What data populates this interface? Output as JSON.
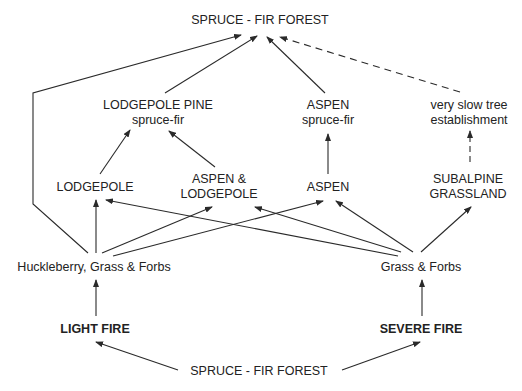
{
  "diagram": {
    "type": "succession-flow",
    "nodes": {
      "top_forest": {
        "label": "SPRUCE - FIR FOREST"
      },
      "lodgepole_pine_sf": {
        "line1": "LODGEPOLE PINE",
        "line2": "spruce-fir"
      },
      "aspen_sf": {
        "line1": "ASPEN",
        "line2": "spruce-fir"
      },
      "slow_tree": {
        "line1": "very slow tree",
        "line2": "establishment"
      },
      "lodgepole": {
        "label": "LODGEPOLE"
      },
      "aspen_lodgepole": {
        "line1": "ASPEN &",
        "line2": "LODGEPOLE"
      },
      "aspen": {
        "label": "ASPEN"
      },
      "subalpine": {
        "line1": "SUBALPINE",
        "line2": "GRASSLAND"
      },
      "huckleberry": {
        "label": "Huckleberry, Grass & Forbs"
      },
      "grass_forbs": {
        "label": "Grass & Forbs"
      },
      "light_fire": {
        "label": "LIGHT FIRE"
      },
      "severe_fire": {
        "label": "SEVERE FIRE"
      },
      "bottom_forest": {
        "label": "SPRUCE - FIR FOREST"
      }
    },
    "edges": [
      {
        "from": "bottom_forest",
        "to": "light_fire",
        "style": "solid"
      },
      {
        "from": "bottom_forest",
        "to": "severe_fire",
        "style": "solid"
      },
      {
        "from": "light_fire",
        "to": "huckleberry",
        "style": "solid"
      },
      {
        "from": "severe_fire",
        "to": "grass_forbs",
        "style": "solid"
      },
      {
        "from": "huckleberry",
        "to": "top_forest",
        "style": "solid"
      },
      {
        "from": "huckleberry",
        "to": "lodgepole",
        "style": "solid"
      },
      {
        "from": "huckleberry",
        "to": "aspen_lodgepole",
        "style": "solid"
      },
      {
        "from": "huckleberry",
        "to": "aspen",
        "style": "solid"
      },
      {
        "from": "grass_forbs",
        "to": "lodgepole",
        "style": "solid"
      },
      {
        "from": "grass_forbs",
        "to": "aspen_lodgepole",
        "style": "solid"
      },
      {
        "from": "grass_forbs",
        "to": "aspen",
        "style": "solid"
      },
      {
        "from": "grass_forbs",
        "to": "subalpine",
        "style": "solid"
      },
      {
        "from": "lodgepole",
        "to": "lodgepole_pine_sf",
        "style": "solid"
      },
      {
        "from": "aspen_lodgepole",
        "to": "lodgepole_pine_sf",
        "style": "solid"
      },
      {
        "from": "aspen",
        "to": "aspen_sf",
        "style": "solid"
      },
      {
        "from": "subalpine",
        "to": "slow_tree",
        "style": "dashed"
      },
      {
        "from": "lodgepole_pine_sf",
        "to": "top_forest",
        "style": "solid"
      },
      {
        "from": "aspen_sf",
        "to": "top_forest",
        "style": "solid"
      },
      {
        "from": "slow_tree",
        "to": "top_forest",
        "style": "dashed"
      }
    ],
    "colors": {
      "line": "#2a2a2a",
      "text": "#222222",
      "background": "#ffffff"
    }
  }
}
